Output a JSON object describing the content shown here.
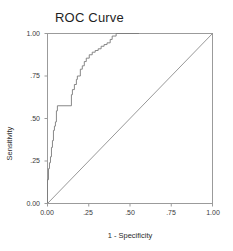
{
  "chart_data": {
    "type": "line",
    "title": "ROC Curve",
    "xlabel": "1 - Specificity",
    "ylabel": "Sensitivity",
    "xlim": [
      0,
      1
    ],
    "ylim": [
      0,
      1
    ],
    "grid": false,
    "legend": null,
    "xticks": [
      "0.00",
      ".25",
      ".50",
      ".75",
      "1.00"
    ],
    "xtick_values": [
      0,
      0.25,
      0.5,
      0.75,
      1.0
    ],
    "yticks": [
      "0.00",
      ".25",
      ".50",
      ".75",
      "1.00"
    ],
    "ytick_values": [
      0,
      0.25,
      0.5,
      0.75,
      1.0
    ],
    "series": [
      {
        "name": "ROC curve",
        "style": "step",
        "color": "#7a7a7a",
        "x": [
          0.0,
          0.0,
          0.006,
          0.006,
          0.012,
          0.012,
          0.018,
          0.018,
          0.024,
          0.024,
          0.03,
          0.03,
          0.036,
          0.036,
          0.042,
          0.042,
          0.048,
          0.048,
          0.054,
          0.054,
          0.06,
          0.06,
          0.145,
          0.145,
          0.151,
          0.151,
          0.163,
          0.163,
          0.175,
          0.175,
          0.181,
          0.181,
          0.199,
          0.199,
          0.211,
          0.211,
          0.223,
          0.223,
          0.235,
          0.235,
          0.253,
          0.253,
          0.271,
          0.271,
          0.289,
          0.289,
          0.307,
          0.307,
          0.325,
          0.325,
          0.343,
          0.343,
          0.361,
          0.361,
          0.38,
          0.38,
          0.392,
          0.392,
          0.416,
          0.416,
          0.554
        ],
        "y": [
          0.0,
          0.14,
          0.14,
          0.205,
          0.205,
          0.24,
          0.24,
          0.275,
          0.275,
          0.33,
          0.33,
          0.37,
          0.37,
          0.43,
          0.43,
          0.455,
          0.455,
          0.48,
          0.48,
          0.545,
          0.545,
          0.575,
          0.575,
          0.64,
          0.64,
          0.67,
          0.67,
          0.7,
          0.7,
          0.73,
          0.73,
          0.75,
          0.75,
          0.79,
          0.79,
          0.81,
          0.81,
          0.835,
          0.835,
          0.855,
          0.855,
          0.875,
          0.875,
          0.89,
          0.89,
          0.9,
          0.9,
          0.91,
          0.91,
          0.925,
          0.925,
          0.935,
          0.935,
          0.945,
          0.945,
          0.965,
          0.965,
          0.985,
          0.985,
          1.0,
          1.0
        ]
      },
      {
        "name": "Reference line",
        "style": "diagonal",
        "color": "#8c8c8c",
        "x": [
          0.0,
          1.0
        ],
        "y": [
          0.0,
          1.0
        ]
      }
    ]
  }
}
